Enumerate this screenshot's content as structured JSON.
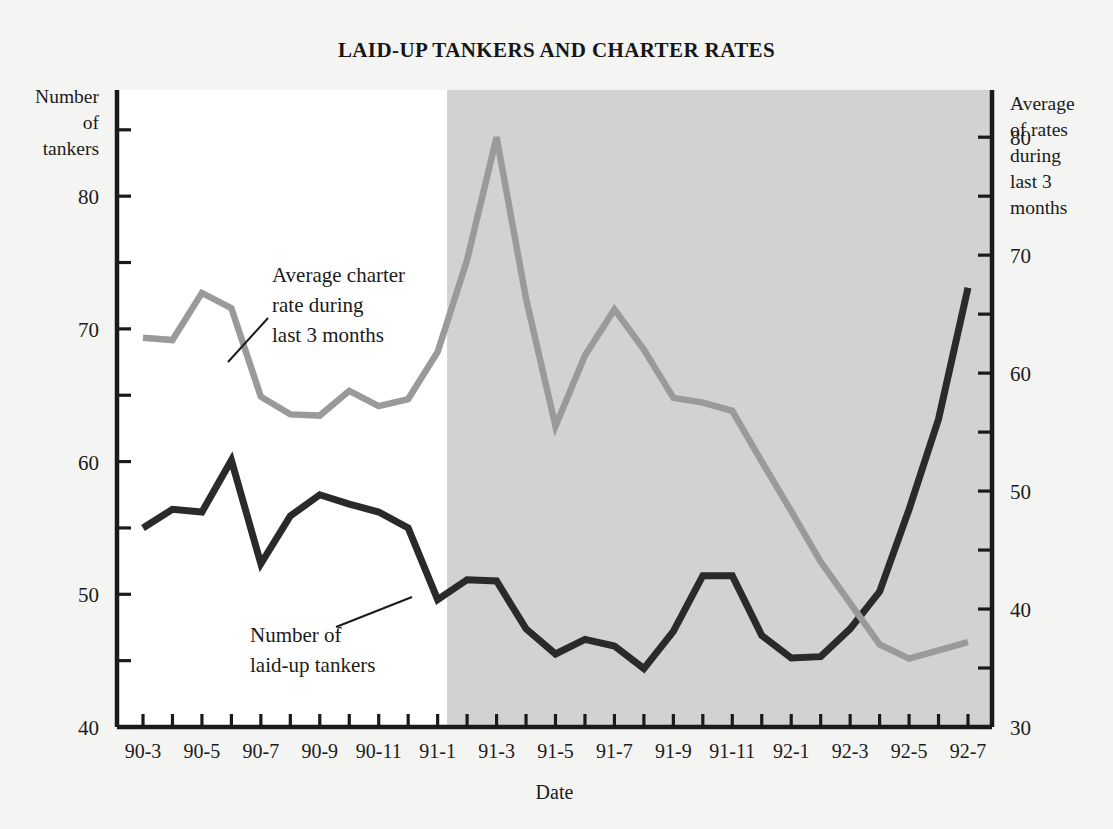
{
  "chart_data": {
    "type": "line",
    "title": "LAID-UP TANKERS AND CHARTER RATES",
    "xlabel": "Date",
    "ylabel_left": "Number of tankers",
    "ylabel_left_lines": [
      "Number",
      "of",
      "tankers"
    ],
    "ylabel_right": "Average of rates during last 3 months",
    "ylabel_right_lines": [
      "Average",
      "of rates",
      "during",
      "last 3",
      "months"
    ],
    "grid": false,
    "legend_position": "inline-annotations",
    "x": [
      "90-3",
      "90-4",
      "90-5",
      "90-6",
      "90-7",
      "90-8",
      "90-9",
      "90-10",
      "90-11",
      "90-12",
      "91-1",
      "91-2",
      "91-3",
      "91-4",
      "91-5",
      "91-6",
      "91-7",
      "91-8",
      "91-9",
      "91-10",
      "91-11",
      "91-12",
      "92-1",
      "92-2",
      "92-3",
      "92-4",
      "92-5",
      "92-6",
      "92-7"
    ],
    "x_tick_labels": [
      "90-3",
      "90-5",
      "90-7",
      "90-9",
      "90-11",
      "91-1",
      "91-3",
      "91-5",
      "91-7",
      "91-9",
      "91-11",
      "92-1",
      "92-3",
      "92-5",
      "92-7"
    ],
    "ylim_left": [
      40,
      88
    ],
    "ylim_right": [
      30,
      84
    ],
    "ytick_labels_left": [
      "40",
      "50",
      "60",
      "70",
      "80"
    ],
    "ytick_values_left": [
      40,
      50,
      60,
      70,
      80
    ],
    "yminor_values_left": [
      45,
      55,
      65,
      75,
      85
    ],
    "ytick_labels_right": [
      "30",
      "40",
      "50",
      "60",
      "70",
      "80"
    ],
    "ytick_values_right": [
      30,
      40,
      50,
      60,
      70,
      80
    ],
    "yminor_values_right": [
      35,
      45,
      55,
      65,
      75
    ],
    "shaded_region_start": "91-2",
    "shaded_region_color": "#d2d2d2",
    "unshaded_region_color": "#ffffff",
    "series": [
      {
        "name": "Number of laid-up tankers",
        "axis": "left",
        "color": "#2a2a2a",
        "annotation": "Number of\nlaid-up tankers",
        "annotation_lines": [
          "Number of",
          "laid-up tankers"
        ],
        "values": [
          55.0,
          56.4,
          56.2,
          60.1,
          52.3,
          55.9,
          57.5,
          56.8,
          56.2,
          55.0,
          49.6,
          51.1,
          51.0,
          47.4,
          45.5,
          46.6,
          46.1,
          44.4,
          47.2,
          51.4,
          51.4,
          46.9,
          45.2,
          45.3,
          47.4,
          50.2,
          56.4,
          63.2,
          73.1
        ]
      },
      {
        "name": "Average charter rate during last 3 months",
        "axis": "right",
        "color": "#9a9a9a",
        "annotation": "Average charter\nrate during\nlast 3 months",
        "annotation_lines": [
          "Average charter",
          "rate during",
          "last 3 months"
        ],
        "values": [
          63.0,
          62.8,
          66.8,
          65.5,
          58.0,
          56.5,
          56.4,
          58.5,
          57.2,
          57.8,
          61.8,
          69.6,
          80.0,
          66.3,
          55.5,
          61.5,
          65.4,
          62.0,
          57.9,
          57.5,
          56.8,
          52.5,
          48.3,
          44.0,
          40.5,
          37.0,
          35.8,
          36.5,
          37.2
        ]
      }
    ],
    "annotations": [
      {
        "text_lines": [
          "Average charter",
          "rate during",
          "last 3 months"
        ],
        "leader_from_x": 246,
        "leader_from_y": 360,
        "leader_to_x": 285,
        "leader_to_y": 322
      },
      {
        "text_lines": [
          "Number of",
          "laid-up tankers"
        ],
        "leader_from_x": 338,
        "leader_from_y": 620,
        "leader_to_x": 415,
        "leader_to_y": 592
      }
    ]
  }
}
